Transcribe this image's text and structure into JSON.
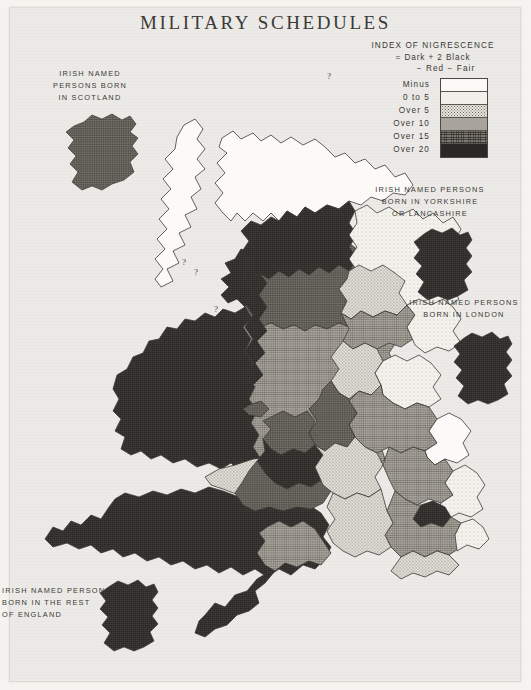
{
  "page": {
    "title": "MILITARY SCHEDULES",
    "background_color": "#eceae6",
    "ink_color": "#3a3936"
  },
  "legend": {
    "name": "index-of-nigrescence-legend",
    "heading_line1": "INDEX OF NIGRESCENCE",
    "heading_line2": "= Dark + 2 Black",
    "heading_line3": "− Red − Fair",
    "classes": [
      {
        "label": "Minus",
        "range_min": null,
        "range_max": 0,
        "swatch": "white",
        "color": "#fbfaf7"
      },
      {
        "label": "0 to 5",
        "range_min": 0,
        "range_max": 5,
        "swatch": "very-light-stipple",
        "color": "#f2f0ea"
      },
      {
        "label": "Over  5",
        "range_min": 5,
        "range_max": 10,
        "swatch": "light-stipple",
        "color": "#e8e5dd"
      },
      {
        "label": "Over  10",
        "range_min": 10,
        "range_max": 15,
        "swatch": "medium-grey-hatch",
        "color": "#a8a49c"
      },
      {
        "label": "Over  15",
        "range_min": 15,
        "range_max": 20,
        "swatch": "dark-grey-hatch",
        "color": "#7e7a72"
      },
      {
        "label": "Over  20",
        "range_min": 20,
        "range_max": null,
        "swatch": "black-hatch",
        "color": "#2a2825"
      }
    ]
  },
  "insets": [
    {
      "name": "inset-scotland",
      "lines": [
        "IRISH NAMED",
        "PERSONS BORN",
        "IN SCOTLAND"
      ],
      "shade_class": "over-15"
    },
    {
      "name": "inset-yorkshire-lancashire",
      "lines": [
        "IRISH NAMED PERSONS",
        "BORN IN YORKSHIRE",
        "OR LANCASHIRE"
      ],
      "shade_class": "over-20"
    },
    {
      "name": "inset-london",
      "lines": [
        "IRISH NAMED PERSONS",
        "BORN IN LONDON"
      ],
      "shade_class": "over-20"
    },
    {
      "name": "inset-rest-of-england",
      "lines": [
        "IRISH NAMED PERSONS",
        "BORN IN THE REST",
        "OF ENGLAND"
      ],
      "shade_class": "over-20"
    }
  ],
  "map": {
    "name": "british-isles-nigrescence-map",
    "annotations": [
      "?",
      "?",
      "?",
      "?"
    ],
    "regions_note": "Counties of Ireland, Scotland, Wales and England shaded by index of nigrescence class"
  }
}
